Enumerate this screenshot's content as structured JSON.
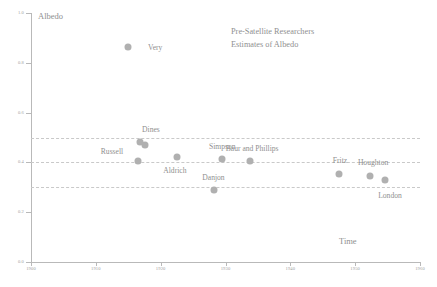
{
  "chart_data": {
    "type": "scatter",
    "title": "Pre-Satellite Researchers\nEstimates of Albedo",
    "title_line1": "Pre-Satellite Researchers",
    "title_line2": "Estimates of Albedo",
    "xlabel": "Time",
    "ylabel": "Albedo",
    "xlim": [
      1900,
      1960
    ],
    "ylim": [
      0.0,
      1.0
    ],
    "grid": true,
    "gridlines_y": [
      0.5,
      0.4,
      0.3
    ],
    "legend": "none",
    "marker_color": "#b0b0b0",
    "axis_color": "#b9b9b9",
    "text_color": "#8f8f8f",
    "xticks": [
      1900,
      1910,
      1920,
      1930,
      1940,
      1950,
      1960
    ],
    "xticklabels": [
      "1900",
      "1910",
      "1920",
      "1930",
      "1940",
      "1950",
      "1960"
    ],
    "yticks": [
      0.0,
      0.2,
      0.4,
      0.6,
      0.8,
      1.0
    ],
    "yticklabels": [
      "0.0",
      "0.2",
      "0.4",
      "0.6",
      "0.8",
      "1.0"
    ],
    "points": [
      {
        "label": "Very",
        "x": 1915.0,
        "y": 0.865,
        "label_dx": 27,
        "label_dy": 0
      },
      {
        "label": "Dines",
        "x": 1916.8,
        "y": 0.48,
        "label_dx": 11,
        "label_dy": -13
      },
      {
        "label": "",
        "x": 1917.6,
        "y": 0.468,
        "label_dx": 0,
        "label_dy": 0
      },
      {
        "label": "Russell",
        "x": 1916.5,
        "y": 0.405,
        "label_dx": -26,
        "label_dy": -10
      },
      {
        "label": "Aldrich",
        "x": 1922.5,
        "y": 0.42,
        "label_dx": -2,
        "label_dy": 13
      },
      {
        "label": "Simpson",
        "x": 1929.5,
        "y": 0.415,
        "label_dx": 0,
        "label_dy": -13
      },
      {
        "label": "Baur and Phillips",
        "x": 1933.8,
        "y": 0.405,
        "label_dx": 2,
        "label_dy": -13
      },
      {
        "label": "Danjon",
        "x": 1928.3,
        "y": 0.288,
        "label_dx": -1,
        "label_dy": -13
      },
      {
        "label": "Fritz",
        "x": 1947.5,
        "y": 0.355,
        "label_dx": 1,
        "label_dy": -14
      },
      {
        "label": "Houghton",
        "x": 1952.3,
        "y": 0.345,
        "label_dx": 3,
        "label_dy": -14
      },
      {
        "label": "London",
        "x": 1954.6,
        "y": 0.33,
        "label_dx": 5,
        "label_dy": 15
      }
    ]
  }
}
